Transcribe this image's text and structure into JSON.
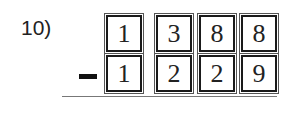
{
  "problem": {
    "number_label": "10)",
    "operator": "minus",
    "top_digits": [
      "1",
      "3",
      "8",
      "8"
    ],
    "bottom_digits": [
      "1",
      "2",
      "2",
      "9"
    ]
  }
}
